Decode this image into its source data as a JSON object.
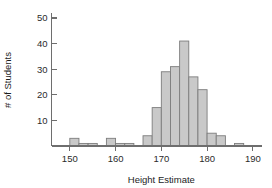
{
  "chart_data": {
    "type": "bar",
    "title": "",
    "xlabel": "Height Estimate",
    "ylabel": "# of Students",
    "xlim": [
      146,
      192
    ],
    "ylim": [
      0,
      53
    ],
    "grid": false,
    "legend": null,
    "bin_width": 2,
    "xticks": [
      150,
      160,
      170,
      180,
      190
    ],
    "yticks": [
      10,
      20,
      30,
      40,
      50
    ],
    "xtick_labels": [
      "150",
      "160",
      "170",
      "180",
      "190"
    ],
    "ytick_labels": [
      "10",
      "20",
      "30",
      "40",
      "50"
    ],
    "bin_starts": [
      150,
      152,
      154,
      158,
      160,
      162,
      166,
      168,
      170,
      172,
      174,
      176,
      178,
      180,
      182,
      186
    ],
    "values": [
      3,
      1,
      1,
      3,
      1,
      1,
      4,
      15,
      29,
      31,
      41,
      27,
      22,
      5,
      4,
      1
    ],
    "bars": [
      {
        "x0": 150,
        "x1": 152,
        "value": 3
      },
      {
        "x0": 152,
        "x1": 154,
        "value": 1
      },
      {
        "x0": 154,
        "x1": 156,
        "value": 1
      },
      {
        "x0": 158,
        "x1": 160,
        "value": 3
      },
      {
        "x0": 160,
        "x1": 162,
        "value": 1
      },
      {
        "x0": 162,
        "x1": 164,
        "value": 1
      },
      {
        "x0": 166,
        "x1": 168,
        "value": 4
      },
      {
        "x0": 168,
        "x1": 170,
        "value": 15
      },
      {
        "x0": 170,
        "x1": 172,
        "value": 29
      },
      {
        "x0": 172,
        "x1": 174,
        "value": 31
      },
      {
        "x0": 174,
        "x1": 176,
        "value": 41
      },
      {
        "x0": 176,
        "x1": 178,
        "value": 27
      },
      {
        "x0": 178,
        "x1": 180,
        "value": 22
      },
      {
        "x0": 180,
        "x1": 182,
        "value": 5
      },
      {
        "x0": 182,
        "x1": 184,
        "value": 4
      },
      {
        "x0": 186,
        "x1": 188,
        "value": 1
      }
    ],
    "colors": {
      "bar_fill": "#c9c9c9",
      "bar_stroke": "#7d7d7d",
      "axis": "#6e6e6e",
      "text": "#1d1d1d",
      "background": "#ffffff"
    }
  }
}
